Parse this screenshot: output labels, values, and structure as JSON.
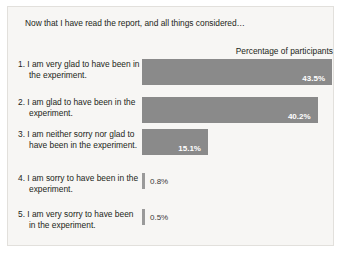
{
  "headline": "Now that I have read the report, and all things considered…",
  "column_header": "Percentage of participants",
  "colors": {
    "bar": "#8a8a8a",
    "bar_thin": "#9a9a9a",
    "panel_background": "#f7f6f4",
    "panel_border": "#e2e0dc",
    "text": "#231f20",
    "value_inside": "#ffffff",
    "value_outside": "#3a3a3a"
  },
  "chart_data": {
    "type": "bar",
    "title": "Now that I have read the report, and all things considered…",
    "subtitle": "",
    "xlabel": "Percentage of participants",
    "ylabel": "",
    "orientation": "horizontal",
    "grid": false,
    "legend": "none",
    "xlim": [
      0,
      43.5
    ],
    "categories": [
      "1. I am very glad to have been in the experiment.",
      "2. I am glad to have been in the experiment.",
      "3. I am neither sorry nor glad to have been in the experiment.",
      "4. I am sorry to have been in the experiment.",
      "5. I am very sorry to have been in the experiment."
    ],
    "values": [
      43.5,
      40.2,
      15.1,
      0.8,
      0.5
    ],
    "value_labels": [
      "43.5%",
      "40.2%",
      "15.1%",
      "0.8%",
      "0.5%"
    ]
  },
  "rows": [
    {
      "number": "1.",
      "label": "1. I am very glad to have been in the experiment.",
      "value": 43.5,
      "value_label": "43.5%",
      "label_inside": true
    },
    {
      "number": "2.",
      "label": "2. I am glad to have been in the experiment.",
      "value": 40.2,
      "value_label": "40.2%",
      "label_inside": true
    },
    {
      "number": "3.",
      "label": "3. I am neither sorry nor glad to have been in the experiment.",
      "value": 15.1,
      "value_label": "15.1%",
      "label_inside": true
    },
    {
      "number": "4.",
      "label": "4. I am sorry to have been in the experiment.",
      "value": 0.8,
      "value_label": "0.8%",
      "label_inside": false
    },
    {
      "number": "5.",
      "label": "5. I am very sorry to have been in the experiment.",
      "value": 0.5,
      "value_label": "0.5%",
      "label_inside": false
    }
  ]
}
